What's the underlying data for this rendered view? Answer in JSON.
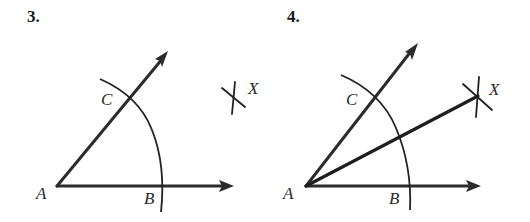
{
  "figure": {
    "panels": [
      {
        "number": "3.",
        "points": {
          "A": {
            "label": "A"
          },
          "B": {
            "label": "B"
          },
          "C": {
            "label": "C"
          },
          "X": {
            "label": "X"
          }
        },
        "description": "Angle with vertex A, arc centered at A crossing rays at B and C, arcs intersecting at point X"
      },
      {
        "number": "4.",
        "points": {
          "A": {
            "label": "A"
          },
          "B": {
            "label": "B"
          },
          "C": {
            "label": "C"
          },
          "X": {
            "label": "X"
          }
        },
        "description": "Ray AX drawn as angle bisector through arc intersection point X"
      }
    ]
  }
}
